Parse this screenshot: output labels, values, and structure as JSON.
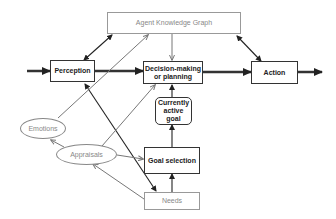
{
  "diagram": {
    "type": "cognitive-architecture-flow",
    "nodes": {
      "knowledge_graph": {
        "label": "Agent Knowledge Graph",
        "style": "light-box"
      },
      "perception": {
        "label": "Perception",
        "style": "bold-box"
      },
      "decision": {
        "label": "Decision-making or planning",
        "style": "bold-box"
      },
      "action": {
        "label": "Action",
        "style": "bold-box"
      },
      "current_goal": {
        "label": "Currently active goal",
        "style": "rounded-bold-box"
      },
      "goal_selection": {
        "label": "Goal selection",
        "style": "bold-box"
      },
      "needs": {
        "label": "Needs",
        "style": "light-box"
      },
      "emotions": {
        "label": "Emotions",
        "style": "ellipse"
      },
      "appraisals": {
        "label": "Appraisals",
        "style": "ellipse"
      }
    },
    "edges": [
      {
        "from": "input",
        "to": "perception",
        "style": "thick"
      },
      {
        "from": "perception",
        "to": "decision",
        "style": "thick"
      },
      {
        "from": "decision",
        "to": "action",
        "style": "thick"
      },
      {
        "from": "action",
        "to": "output",
        "style": "thick"
      },
      {
        "from": "perception",
        "to": "knowledge_graph",
        "style": "dark-bidirectional"
      },
      {
        "from": "action",
        "to": "knowledge_graph",
        "style": "dark-bidirectional"
      },
      {
        "from": "knowledge_graph",
        "to": "decision",
        "style": "gray"
      },
      {
        "from": "current_goal",
        "to": "decision",
        "style": "dark"
      },
      {
        "from": "goal_selection",
        "to": "current_goal",
        "style": "dark"
      },
      {
        "from": "needs",
        "to": "goal_selection",
        "style": "dark"
      },
      {
        "from": "perception",
        "to": "needs",
        "style": "dark-bidirectional"
      },
      {
        "from": "emotions",
        "to": "knowledge_graph",
        "style": "gray"
      },
      {
        "from": "appraisals",
        "to": "decision",
        "style": "gray"
      },
      {
        "from": "appraisals",
        "to": "emotions",
        "style": "gray"
      },
      {
        "from": "appraisals",
        "to": "goal_selection",
        "style": "gray"
      },
      {
        "from": "needs",
        "to": "appraisals",
        "style": "gray"
      }
    ]
  }
}
